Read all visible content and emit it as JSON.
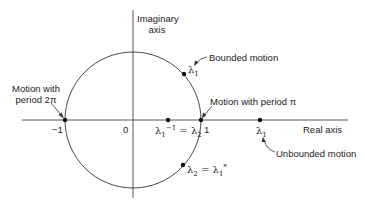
{
  "diagram": {
    "axes": {
      "imaginary_label_line1": "Imaginary",
      "imaginary_label_line2": "axis",
      "real_label": "Real axis"
    },
    "ticks": {
      "minus_one": "−1",
      "zero": "0",
      "one": "1"
    },
    "annotations": {
      "bounded": "Bounded motion",
      "period_pi": "Motion with period π",
      "period_2pi_line1": "Motion with",
      "period_2pi_line2": "period 2π",
      "unbounded": "Unbounded motion"
    },
    "points": {
      "upper_lambda": "λ",
      "upper_lambda_sub": "1",
      "inner_lambda": "λ",
      "inner_lambda_sub": "1",
      "inner_lambda_sup": "−1",
      "inner_eq": " = λ",
      "inner_eq_sub": "2",
      "outer_lambda": "λ",
      "outer_lambda_sub": "1",
      "lower_lambda": "λ",
      "lower_lambda_sub": "2",
      "lower_eq": " = λ",
      "lower_eq_sub": "1",
      "lower_eq_sup": "*"
    },
    "colors": {
      "line": "#333333",
      "text": "#222222"
    }
  }
}
